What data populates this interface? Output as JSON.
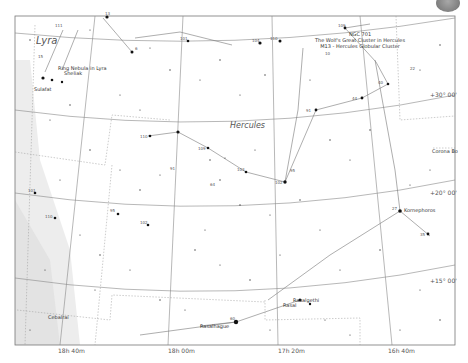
{
  "chart": {
    "constellations": [
      {
        "name": "Lyra",
        "x": 36,
        "y": 44,
        "size": 10
      },
      {
        "name": "Hercules",
        "x": 230,
        "y": 128,
        "size": 8
      }
    ],
    "ra_labels": [
      {
        "text": "18h 40m",
        "x": 58,
        "y": 353
      },
      {
        "text": "18h 00m",
        "x": 168,
        "y": 353
      },
      {
        "text": "17h 20m",
        "x": 278,
        "y": 353
      },
      {
        "text": "16h 40m",
        "x": 388,
        "y": 353
      }
    ],
    "dec_labels": [
      {
        "text": "+30° 00'",
        "x": 448,
        "y": 108
      },
      {
        "text": "+20° 00'",
        "x": 448,
        "y": 195
      },
      {
        "text": "+15° 00'",
        "x": 448,
        "y": 283
      }
    ],
    "dso_labels": [
      {
        "id": "ngc_block",
        "lines": [
          "NGC 701",
          "The Wolf's Great Cluster in Hercules",
          "M13 - Hercules Globular Cluster"
        ],
        "x": 360,
        "y": 41
      },
      {
        "id": "ring_nebula",
        "lines": [
          "Ring Nebula in Lyra",
          "Sheliak"
        ],
        "x": 58,
        "y": 69
      },
      {
        "id": "sulafat",
        "lines": [
          "Sulafat"
        ],
        "x": 38,
        "y": 90
      },
      {
        "id": "corona",
        "lines": [
          "Corona Bo"
        ],
        "x": 452,
        "y": 153
      },
      {
        "id": "kornephoros",
        "lines": [
          "Kornephoros"
        ],
        "x": 414,
        "y": 211
      },
      {
        "id": "rasalgethi",
        "lines": [
          "Rasalgethi",
          "Rasal"
        ],
        "x": 296,
        "y": 301
      },
      {
        "id": "rasalhague",
        "lines": [
          "Rasalhague"
        ],
        "x": 210,
        "y": 328
      },
      {
        "id": "cebalrai",
        "lines": [
          "Cebalrai"
        ],
        "x": 55,
        "y": 318
      }
    ],
    "colors": {
      "grid": "#888888",
      "boundary": "#999999",
      "figure": "#777777",
      "milkyway": "#ececec",
      "star": "#111111"
    }
  }
}
